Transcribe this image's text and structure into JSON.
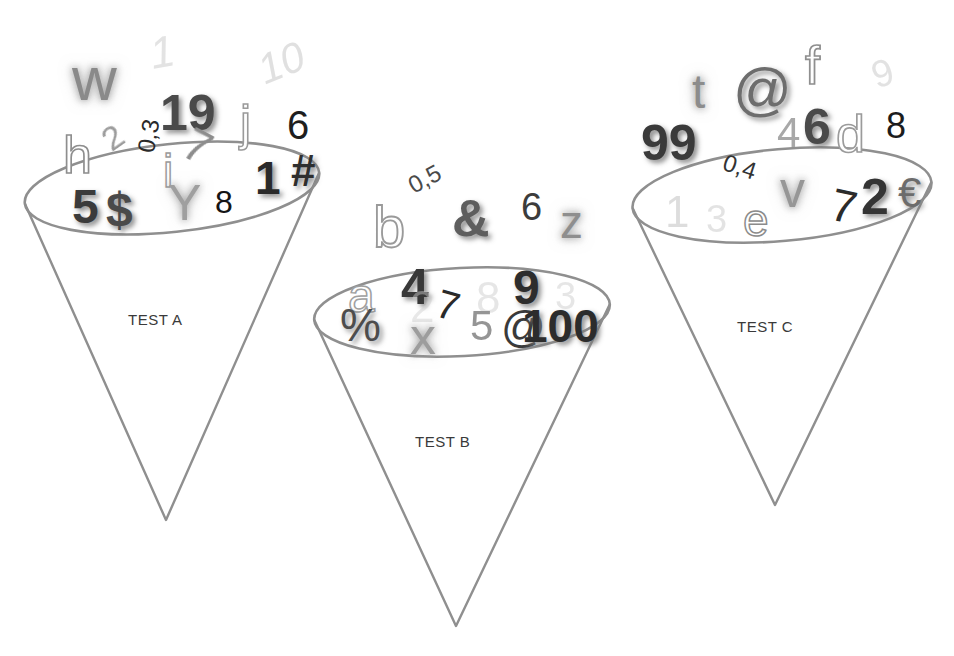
{
  "canvas": {
    "width": 954,
    "height": 656,
    "background": "#ffffff"
  },
  "image_kind": "illustration",
  "palette": {
    "cone_outline": "#8f8f8f",
    "label_text": "#3a3a3a",
    "glyph_dark": "#1a1a1a",
    "glyph_mid": "#6e6e6e",
    "glyph_light": "#b9b9b9",
    "background": "#ffffff"
  },
  "cones": [
    {
      "id": "cone-a",
      "label": "TEST A",
      "label_x": 128,
      "label_y": 311,
      "ellipse": {
        "cx": 172,
        "cy": 188,
        "rx": 148,
        "ry": 44,
        "rot": -6
      },
      "apex": {
        "x": 166,
        "y": 520
      }
    },
    {
      "id": "cone-b",
      "label": "TEST B",
      "label_x": 415,
      "label_y": 433,
      "ellipse": {
        "cx": 462,
        "cy": 312,
        "rx": 148,
        "ry": 44,
        "rot": -3
      },
      "apex": {
        "x": 456,
        "y": 626
      }
    },
    {
      "id": "cone-c",
      "label": "TEST C",
      "label_x": 737,
      "label_y": 318,
      "ellipse": {
        "cx": 782,
        "cy": 195,
        "rx": 150,
        "ry": 46,
        "rot": -5
      },
      "apex": {
        "x": 775,
        "y": 505
      }
    }
  ],
  "glyph_groups": [
    {
      "cone": "cone-a",
      "glyphs": [
        {
          "text": "w",
          "x": 72,
          "y": 48,
          "size": 62,
          "color": "#8a8a8a",
          "weight": "400",
          "style": "normal",
          "rot": 0,
          "render": "st-glow"
        },
        {
          "text": "1",
          "x": 150,
          "y": 30,
          "size": 44,
          "color": "#c2c2c2",
          "weight": "400",
          "style": "italic",
          "rot": -10,
          "render": "st-faint"
        },
        {
          "text": "19",
          "x": 160,
          "y": 88,
          "size": 50,
          "color": "#4a4a4a",
          "weight": "700",
          "style": "normal",
          "rot": 0,
          "render": "st-shadow"
        },
        {
          "text": "10",
          "x": 258,
          "y": 42,
          "size": 42,
          "color": "#bcbcbc",
          "weight": "400",
          "style": "italic",
          "rot": -22,
          "render": "st-faint"
        },
        {
          "text": "j",
          "x": 240,
          "y": 98,
          "size": 50,
          "color": "#9a9a9a",
          "weight": "400",
          "style": "normal",
          "rot": 0,
          "render": "st-outline"
        },
        {
          "text": "6",
          "x": 287,
          "y": 105,
          "size": 40,
          "color": "#1e1e1e",
          "weight": "400",
          "style": "normal",
          "rot": 0,
          "render": "st-solid"
        },
        {
          "text": "h",
          "x": 63,
          "y": 129,
          "size": 52,
          "color": "#8e8e8e",
          "weight": "400",
          "style": "normal",
          "rot": 0,
          "render": "st-outline"
        },
        {
          "text": "2",
          "x": 103,
          "y": 120,
          "size": 34,
          "color": "#9c9c9c",
          "weight": "400",
          "style": "normal",
          "rot": -35,
          "render": "st-soft"
        },
        {
          "text": "0,3",
          "x": 132,
          "y": 124,
          "size": 24,
          "color": "#2a2a2a",
          "weight": "400",
          "style": "normal",
          "rot": -80,
          "render": "st-solid"
        },
        {
          "text": "7",
          "x": 185,
          "y": 123,
          "size": 46,
          "color": "#8d8d8d",
          "weight": "400",
          "style": "normal",
          "rot": 28,
          "render": "st-soft"
        },
        {
          "text": "i",
          "x": 163,
          "y": 148,
          "size": 46,
          "color": "#9b9b9b",
          "weight": "400",
          "style": "normal",
          "rot": 0,
          "render": "st-outline"
        },
        {
          "text": "5",
          "x": 72,
          "y": 183,
          "size": 48,
          "color": "#3b3b3b",
          "weight": "700",
          "style": "normal",
          "rot": 0,
          "render": "st-shadow"
        },
        {
          "text": "$",
          "x": 106,
          "y": 186,
          "size": 48,
          "color": "#4a4a4a",
          "weight": "700",
          "style": "normal",
          "rot": 0,
          "render": "st-shadow"
        },
        {
          "text": "Y",
          "x": 168,
          "y": 178,
          "size": 50,
          "color": "#9f9f9f",
          "weight": "400",
          "style": "normal",
          "rot": 0,
          "render": "st-glow"
        },
        {
          "text": "8",
          "x": 215,
          "y": 186,
          "size": 32,
          "color": "#141414",
          "weight": "400",
          "style": "normal",
          "rot": 0,
          "render": "st-solid"
        },
        {
          "text": "1",
          "x": 255,
          "y": 155,
          "size": 46,
          "color": "#2a2a2a",
          "weight": "700",
          "style": "normal",
          "rot": 0,
          "render": "st-shadow"
        },
        {
          "text": "#",
          "x": 291,
          "y": 149,
          "size": 44,
          "color": "#2e2e2e",
          "weight": "700",
          "style": "normal",
          "rot": 0,
          "render": "st-shadow"
        }
      ]
    },
    {
      "cone": "cone-b",
      "glyphs": [
        {
          "text": "0,5",
          "x": 408,
          "y": 167,
          "size": 24,
          "color": "#4a4a4a",
          "weight": "400",
          "style": "normal",
          "rot": -28,
          "render": "st-solid"
        },
        {
          "text": "b",
          "x": 373,
          "y": 198,
          "size": 58,
          "color": "#9a9a9a",
          "weight": "400",
          "style": "normal",
          "rot": 0,
          "render": "st-outline"
        },
        {
          "text": "&",
          "x": 452,
          "y": 192,
          "size": 52,
          "color": "#5e5e5e",
          "weight": "700",
          "style": "normal",
          "rot": 0,
          "render": "st-shadow"
        },
        {
          "text": "6",
          "x": 521,
          "y": 188,
          "size": 38,
          "color": "#3c3c3c",
          "weight": "400",
          "style": "normal",
          "rot": 0,
          "render": "st-solid"
        },
        {
          "text": "z",
          "x": 560,
          "y": 199,
          "size": 46,
          "color": "#8e8e8e",
          "weight": "400",
          "style": "normal",
          "rot": 0,
          "render": "st-glow"
        },
        {
          "text": "a",
          "x": 348,
          "y": 272,
          "size": 48,
          "color": "#a0a0a0",
          "weight": "400",
          "style": "normal",
          "rot": 0,
          "render": "st-outline"
        },
        {
          "text": "4",
          "x": 401,
          "y": 262,
          "size": 50,
          "color": "#383838",
          "weight": "700",
          "style": "normal",
          "rot": 0,
          "render": "st-shadow"
        },
        {
          "text": "2",
          "x": 410,
          "y": 285,
          "size": 44,
          "color": "#cfcfcf",
          "weight": "400",
          "style": "normal",
          "rot": 0,
          "render": "st-faint"
        },
        {
          "text": "7",
          "x": 437,
          "y": 285,
          "size": 40,
          "color": "#2a2a2a",
          "weight": "400",
          "style": "normal",
          "rot": 16,
          "render": "st-solid"
        },
        {
          "text": "8",
          "x": 476,
          "y": 276,
          "size": 44,
          "color": "#cacaca",
          "weight": "400",
          "style": "normal",
          "rot": 0,
          "render": "st-faint"
        },
        {
          "text": "9",
          "x": 513,
          "y": 264,
          "size": 48,
          "color": "#2d2d2d",
          "weight": "700",
          "style": "normal",
          "rot": 0,
          "render": "st-shadow"
        },
        {
          "text": "3",
          "x": 555,
          "y": 277,
          "size": 38,
          "color": "#c9c9c9",
          "weight": "400",
          "style": "normal",
          "rot": 0,
          "render": "st-faint"
        },
        {
          "text": "%",
          "x": 340,
          "y": 302,
          "size": 46,
          "color": "#4d4d4d",
          "weight": "400",
          "style": "normal",
          "rot": 0,
          "render": "st-shadow"
        },
        {
          "text": "x",
          "x": 410,
          "y": 310,
          "size": 52,
          "color": "#9d9d9d",
          "weight": "400",
          "style": "normal",
          "rot": 0,
          "render": "st-glow"
        },
        {
          "text": "5",
          "x": 470,
          "y": 305,
          "size": 42,
          "color": "#959595",
          "weight": "400",
          "style": "normal",
          "rot": 0,
          "render": "st-soft"
        },
        {
          "text": "@",
          "x": 501,
          "y": 305,
          "size": 44,
          "color": "#3a3a3a",
          "weight": "400",
          "style": "normal",
          "rot": 0,
          "render": "st-solid"
        },
        {
          "text": "100",
          "x": 522,
          "y": 303,
          "size": 46,
          "color": "#2c2c2c",
          "weight": "700",
          "style": "normal",
          "rot": 0,
          "render": "st-shadow"
        }
      ]
    },
    {
      "cone": "cone-c",
      "glyphs": [
        {
          "text": "t",
          "x": 692,
          "y": 68,
          "size": 48,
          "color": "#8c8c8c",
          "weight": "400",
          "style": "normal",
          "rot": 0,
          "render": "st-glow"
        },
        {
          "text": "@",
          "x": 733,
          "y": 60,
          "size": 58,
          "color": "#6d6d6d",
          "weight": "400",
          "style": "normal",
          "rot": 0,
          "render": "st-shadow"
        },
        {
          "text": "f",
          "x": 805,
          "y": 38,
          "size": 54,
          "color": "#8f8f8f",
          "weight": "400",
          "style": "normal",
          "rot": 0,
          "render": "st-outline"
        },
        {
          "text": "9",
          "x": 872,
          "y": 54,
          "size": 38,
          "color": "#c1c1c1",
          "weight": "400",
          "style": "normal",
          "rot": -18,
          "render": "st-faint"
        },
        {
          "text": "99",
          "x": 641,
          "y": 118,
          "size": 50,
          "color": "#3a3a3a",
          "weight": "700",
          "style": "normal",
          "rot": 0,
          "render": "st-shadow"
        },
        {
          "text": "4",
          "x": 777,
          "y": 112,
          "size": 42,
          "color": "#a8a8a8",
          "weight": "400",
          "style": "normal",
          "rot": 0,
          "render": "st-soft"
        },
        {
          "text": "6",
          "x": 803,
          "y": 102,
          "size": 50,
          "color": "#4a4a4a",
          "weight": "700",
          "style": "normal",
          "rot": 0,
          "render": "st-shadow"
        },
        {
          "text": "d",
          "x": 836,
          "y": 108,
          "size": 52,
          "color": "#9b9b9b",
          "weight": "400",
          "style": "normal",
          "rot": 0,
          "render": "st-outline"
        },
        {
          "text": "8",
          "x": 886,
          "y": 108,
          "size": 36,
          "color": "#1c1c1c",
          "weight": "400",
          "style": "normal",
          "rot": 0,
          "render": "st-solid"
        },
        {
          "text": "0,4",
          "x": 723,
          "y": 155,
          "size": 24,
          "color": "#333333",
          "weight": "400",
          "style": "normal",
          "rot": 18,
          "render": "st-solid"
        },
        {
          "text": "v",
          "x": 780,
          "y": 165,
          "size": 50,
          "color": "#969696",
          "weight": "400",
          "style": "normal",
          "rot": 0,
          "render": "st-glow"
        },
        {
          "text": "2",
          "x": 861,
          "y": 172,
          "size": 50,
          "color": "#343434",
          "weight": "700",
          "style": "normal",
          "rot": 0,
          "render": "st-shadow"
        },
        {
          "text": "€",
          "x": 898,
          "y": 172,
          "size": 42,
          "color": "#6c6c6c",
          "weight": "400",
          "style": "normal",
          "rot": 0,
          "render": "st-shadow"
        },
        {
          "text": "1",
          "x": 665,
          "y": 190,
          "size": 44,
          "color": "#b6b6b6",
          "weight": "400",
          "style": "normal",
          "rot": 0,
          "render": "st-faint"
        },
        {
          "text": "3",
          "x": 706,
          "y": 200,
          "size": 38,
          "color": "#c3c3c3",
          "weight": "400",
          "style": "normal",
          "rot": 0,
          "render": "st-faint"
        },
        {
          "text": "e",
          "x": 743,
          "y": 197,
          "size": 46,
          "color": "#8b8b8b",
          "weight": "400",
          "style": "normal",
          "rot": 0,
          "render": "st-outline"
        },
        {
          "text": "7",
          "x": 831,
          "y": 183,
          "size": 46,
          "color": "#2b2b2b",
          "weight": "400",
          "style": "normal",
          "rot": 12,
          "render": "st-solid"
        }
      ]
    }
  ]
}
